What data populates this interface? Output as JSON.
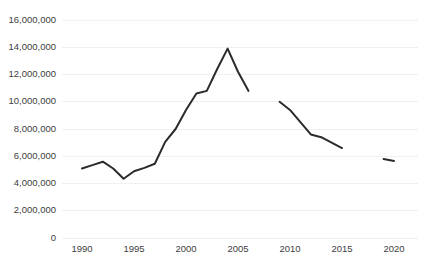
{
  "chart_data": {
    "type": "line",
    "title": "",
    "xlabel": "",
    "ylabel": "",
    "xlim": [
      1989,
      2021
    ],
    "ylim": [
      0,
      16000000
    ],
    "grid": true,
    "legend": false,
    "line_color": "#2b2b2b",
    "line_width": 2,
    "has_markers": false,
    "y_ticks": [
      0,
      2000000,
      4000000,
      6000000,
      8000000,
      10000000,
      12000000,
      14000000,
      16000000
    ],
    "y_tick_labels": [
      "0",
      "2,000,000",
      "4,000,000",
      "6,000,000",
      "8,000,000",
      "10,000,000",
      "12,000,000",
      "14,000,000",
      "16,000,000"
    ],
    "x_ticks": [
      1990,
      1995,
      2000,
      2005,
      2010,
      2015,
      2020
    ],
    "x_tick_labels": [
      "1990",
      "1995",
      "2000",
      "2005",
      "2010",
      "2015",
      "2020"
    ],
    "series": [
      {
        "name": "series-1",
        "note": "null values render as gaps in the line",
        "x": [
          1990,
          1991,
          1992,
          1993,
          1994,
          1995,
          1996,
          1997,
          1998,
          1999,
          2000,
          2001,
          2002,
          2003,
          2004,
          2005,
          2006,
          2007,
          2008,
          2009,
          2010,
          2011,
          2012,
          2013,
          2014,
          2015,
          2016,
          2017,
          2018,
          2019,
          2020
        ],
        "values": [
          5100000,
          5350000,
          5600000,
          5100000,
          4350000,
          4900000,
          5150000,
          5450000,
          7050000,
          8000000,
          9400000,
          10600000,
          10800000,
          12400000,
          13900000,
          12200000,
          10800000,
          null,
          null,
          10000000,
          9400000,
          8500000,
          7600000,
          7400000,
          7000000,
          6600000,
          null,
          null,
          null,
          5800000,
          5650000
        ]
      }
    ],
    "caption": ""
  }
}
